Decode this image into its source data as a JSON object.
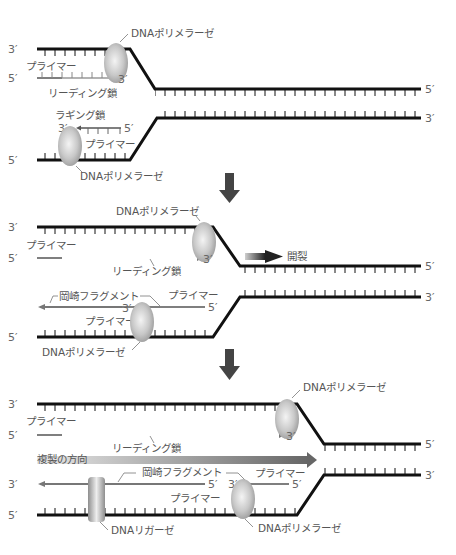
{
  "labels": {
    "dna_polymerase": "DNAポリメラーゼ",
    "primer": "プライマー",
    "leading_strand": "リーディング鎖",
    "lagging_strand": "ラギング鎖",
    "okazaki_fragment": "岡崎フラグメント",
    "unwinding": "開裂",
    "replication_direction": "複製の方向",
    "dna_ligase": "DNAリガーゼ",
    "three_prime": "3′",
    "five_prime": "5′"
  },
  "panels": [
    {
      "id": 1,
      "stage": "initial",
      "elements": [
        "leading strand primer + polymerase",
        "lagging strand primer + polymerase"
      ]
    },
    {
      "id": 2,
      "stage": "elongation and unwinding",
      "elements": [
        "leading strand extended",
        "Okazaki fragment",
        "new primer",
        "unwinding arrow"
      ]
    },
    {
      "id": 3,
      "stage": "ligation",
      "elements": [
        "leading strand extended further",
        "replication direction arrow",
        "DNA ligase joins Okazaki fragments",
        "new primer + polymerase"
      ]
    }
  ],
  "colors": {
    "template_strand": "#111111",
    "new_strand": "#888888",
    "primer": "#555555",
    "enzyme": "#bdbdbd",
    "step_arrow": "#444444",
    "text": "#555555"
  }
}
